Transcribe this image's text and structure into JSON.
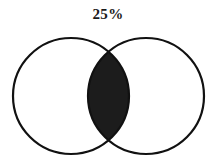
{
  "diagram": {
    "type": "venn",
    "label": "25%",
    "sets": [
      {
        "name": "left-circle",
        "cx": 71,
        "cy": 96,
        "r": 58
      },
      {
        "name": "right-circle",
        "cx": 146,
        "cy": 96,
        "r": 58
      }
    ],
    "shaded_region": "intersection",
    "colors": {
      "background": "#ffffff",
      "stroke": "#111111",
      "fill": "#1c1c1c"
    }
  }
}
